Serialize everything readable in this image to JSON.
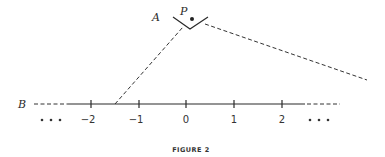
{
  "figure": {
    "caption": "FIGURE 2",
    "labels": {
      "A": "A",
      "P": "P",
      "B": "B"
    },
    "ellipsis_left": "• • •",
    "ellipsis_right": "• • •"
  },
  "number_line": {
    "ticks": [
      {
        "value": -2,
        "label": "−2",
        "x": 91
      },
      {
        "value": -1,
        "label": "−1",
        "x": 139
      },
      {
        "value": 0,
        "label": "0",
        "x": 186
      },
      {
        "value": 1,
        "label": "1",
        "x": 234
      },
      {
        "value": 2,
        "label": "2",
        "x": 282
      }
    ]
  },
  "colors": {
    "ink": "#2a2a2a",
    "background": "#ffffff"
  }
}
